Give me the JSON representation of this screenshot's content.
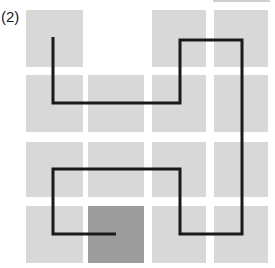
{
  "figure": {
    "label": "(2)",
    "colors": {
      "cell_light": "#d8d8d8",
      "cell_dark": "#9c9c9c",
      "path": "#1a1a1a",
      "background": "#ffffff"
    },
    "grid": {
      "rows": 4,
      "cols": 4,
      "col_x": [
        [
          26,
          83
        ],
        [
          88,
          144
        ],
        [
          152,
          206
        ],
        [
          214,
          268
        ]
      ],
      "row_y": [
        [
          10,
          67
        ],
        [
          75,
          132
        ],
        [
          142,
          197
        ],
        [
          206,
          263
        ]
      ],
      "cells": [
        {
          "row": 0,
          "col": 0,
          "state": "light"
        },
        {
          "row": 0,
          "col": 1,
          "state": "empty"
        },
        {
          "row": 0,
          "col": 2,
          "state": "light"
        },
        {
          "row": 0,
          "col": 3,
          "state": "light"
        },
        {
          "row": 1,
          "col": 0,
          "state": "light"
        },
        {
          "row": 1,
          "col": 1,
          "state": "light"
        },
        {
          "row": 1,
          "col": 2,
          "state": "light"
        },
        {
          "row": 1,
          "col": 3,
          "state": "light"
        },
        {
          "row": 2,
          "col": 0,
          "state": "light"
        },
        {
          "row": 2,
          "col": 1,
          "state": "light"
        },
        {
          "row": 2,
          "col": 2,
          "state": "light"
        },
        {
          "row": 2,
          "col": 3,
          "state": "light"
        },
        {
          "row": 3,
          "col": 0,
          "state": "light"
        },
        {
          "row": 3,
          "col": 1,
          "state": "dark"
        },
        {
          "row": 3,
          "col": 2,
          "state": "light"
        },
        {
          "row": 3,
          "col": 3,
          "state": "light"
        }
      ]
    },
    "path_points": [
      [
        53,
        37
      ],
      [
        53,
        103
      ],
      [
        180,
        103
      ],
      [
        180,
        40
      ],
      [
        242,
        40
      ],
      [
        242,
        234
      ],
      [
        180,
        234
      ],
      [
        180,
        169
      ],
      [
        53,
        169
      ],
      [
        53,
        234
      ],
      [
        116,
        234
      ]
    ]
  }
}
